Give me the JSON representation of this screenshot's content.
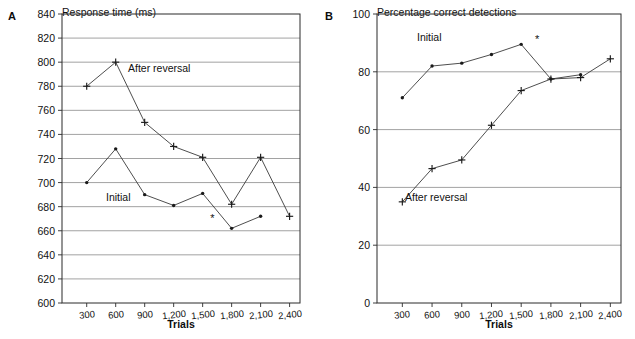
{
  "figure": {
    "panels": [
      {
        "letter": "A",
        "axis_title": "Response time (ms)",
        "xlabel": "Trials",
        "series_labels": {
          "initial": "Initial",
          "after_reversal": "After reversal"
        },
        "annotation": "*"
      },
      {
        "letter": "B",
        "axis_title": "Percentage correct detections",
        "xlabel": "Trials",
        "series_labels": {
          "initial": "Initial",
          "after_reversal": "After reversal"
        },
        "annotation": "*"
      }
    ]
  },
  "chart_data": [
    {
      "type": "line",
      "panel": "A",
      "title": "Response time (ms)",
      "xlabel": "Trials",
      "ylabel": "Response time (ms)",
      "categories": [
        300,
        600,
        900,
        1200,
        1500,
        1800,
        2100,
        2400
      ],
      "tick_labels": [
        "300",
        "600",
        "900",
        "1,200",
        "1,500",
        "1,800",
        "2,100",
        "2,400"
      ],
      "ylim": [
        600,
        840
      ],
      "ytick_values": [
        600,
        620,
        640,
        660,
        680,
        700,
        720,
        740,
        760,
        780,
        800,
        820,
        840
      ],
      "ytick_labels": [
        "600",
        "620",
        "640",
        "660",
        "680",
        "700",
        "720",
        "740",
        "760",
        "780",
        "800",
        "820",
        "840"
      ],
      "grid": true,
      "legend": "inline-labels",
      "series": [
        {
          "name": "Initial",
          "marker": "dot",
          "x": [
            300,
            600,
            900,
            1200,
            1500,
            1800,
            2100
          ],
          "values": [
            700,
            728,
            690,
            681,
            691,
            662,
            672
          ]
        },
        {
          "name": "After reversal",
          "marker": "cross",
          "x": [
            300,
            600,
            900,
            1200,
            1500,
            1800,
            2100,
            2400
          ],
          "values": [
            780,
            800,
            750,
            730,
            721,
            682,
            721,
            672
          ]
        }
      ],
      "annotations": [
        {
          "text": "*",
          "x": 1600,
          "y": 667
        }
      ]
    },
    {
      "type": "line",
      "panel": "B",
      "title": "Percentage correct detections",
      "xlabel": "Trials",
      "ylabel": "Percentage correct detections",
      "categories": [
        300,
        600,
        900,
        1200,
        1500,
        1800,
        2100,
        2400
      ],
      "tick_labels": [
        "300",
        "600",
        "900",
        "1,200",
        "1,500",
        "1,800",
        "2,100",
        "2,400"
      ],
      "ylim": [
        0,
        100
      ],
      "ytick_values": [
        0,
        20,
        40,
        60,
        80,
        100
      ],
      "ytick_labels": [
        "0",
        "20",
        "40",
        "60",
        "80",
        "100"
      ],
      "grid": true,
      "legend": "inline-labels",
      "series": [
        {
          "name": "Initial",
          "marker": "dot",
          "x": [
            300,
            600,
            900,
            1200,
            1500,
            1800,
            2100
          ],
          "values": [
            71,
            82,
            83,
            86,
            89.5,
            77.5,
            79
          ]
        },
        {
          "name": "After reversal",
          "marker": "cross",
          "x": [
            300,
            600,
            900,
            1200,
            1500,
            1800,
            2100,
            2400
          ],
          "values": [
            35,
            46.5,
            49.5,
            61.5,
            73.5,
            77.5,
            78,
            84.5
          ]
        }
      ],
      "annotations": [
        {
          "text": "*",
          "x": 1660,
          "y": 90
        }
      ]
    }
  ]
}
